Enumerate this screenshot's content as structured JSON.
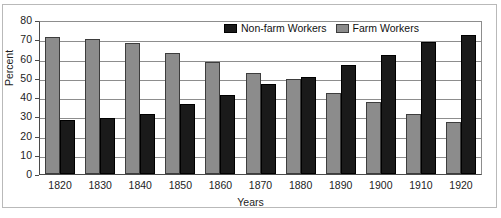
{
  "chart_data": {
    "type": "bar",
    "title": "",
    "xlabel": "Years",
    "ylabel": "Percent",
    "ylim": [
      0,
      80
    ],
    "ytick_step": 10,
    "yticks": [
      80,
      70,
      60,
      50,
      40,
      30,
      20,
      10,
      0
    ],
    "grid": true,
    "legend_position": "top-right-inside",
    "categories": [
      "1820",
      "1830",
      "1840",
      "1850",
      "1860",
      "1870",
      "1880",
      "1890",
      "1900",
      "1910",
      "1920"
    ],
    "series": [
      {
        "name": "Non-farm Workers",
        "color": "#1a1a1a",
        "values": [
          28.2,
          29.5,
          31.5,
          36.5,
          41.2,
          47.2,
          50.5,
          56.8,
          62.0,
          68.8,
          72.8
        ]
      },
      {
        "name": "Farm Workers",
        "color": "#8c8c8c",
        "values": [
          71.8,
          70.5,
          68.5,
          63.5,
          58.8,
          52.8,
          49.8,
          42.5,
          37.5,
          31.2,
          27.0
        ]
      }
    ]
  },
  "legend": {
    "items": [
      {
        "label": "Non-farm Workers",
        "swatch": "dark-swatch"
      },
      {
        "label": "Farm Workers",
        "swatch": "gray-swatch"
      }
    ]
  },
  "axes": {
    "y_title": "Percent",
    "x_title": "Years"
  }
}
